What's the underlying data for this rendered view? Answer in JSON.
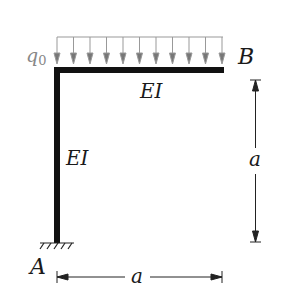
{
  "diagram": {
    "type": "portal-frame",
    "load": {
      "label": "q",
      "subscript": "0",
      "arrow_count": 11,
      "color": "#888888"
    },
    "nodes": {
      "top_right": "B",
      "bottom_left": "A"
    },
    "members": {
      "beam_label": "EI",
      "column_label": "EI"
    },
    "dimensions": {
      "vertical": "a",
      "horizontal": "a"
    },
    "support": "fixed",
    "colors": {
      "member": "#111111",
      "load": "#888888",
      "dimension": "#222222"
    }
  }
}
